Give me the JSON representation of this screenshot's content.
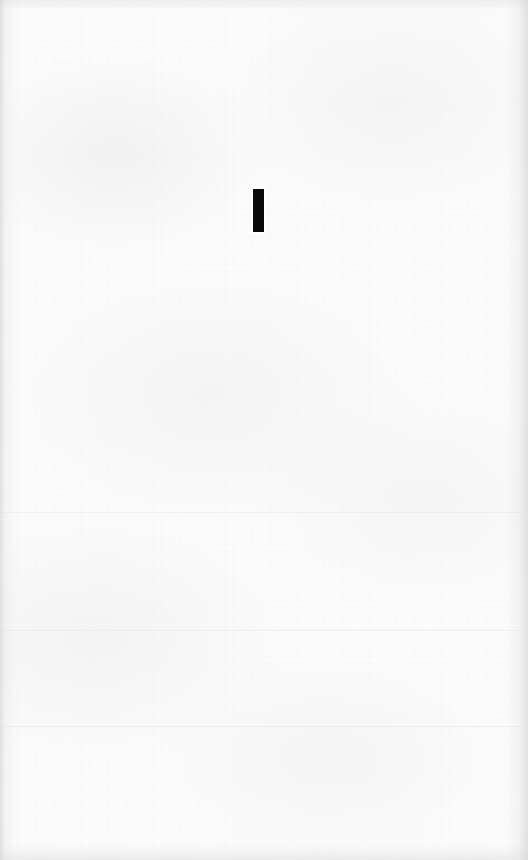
{
  "page": {
    "width": 528,
    "height": 860,
    "background_color": "#fcfcfc",
    "edge_shading_color": "#cdcdcd"
  },
  "content": {
    "glyph": {
      "character": "I",
      "name": "vertical-bar-glyph",
      "color": "#0a0a0a",
      "left": 253,
      "top": 189,
      "width": 11,
      "height": 43
    }
  },
  "scan_bands": [
    {
      "top": 512
    },
    {
      "top": 630
    },
    {
      "top": 726
    }
  ]
}
